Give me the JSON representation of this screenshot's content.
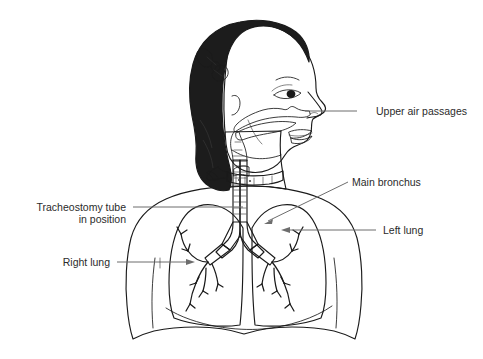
{
  "palette": {
    "background": "#ffffff",
    "ink": "#1a1a1a",
    "hair": "#1c1c1c",
    "skin": "#c9c9c9",
    "skin_shadow": "#bdbdbd",
    "torso": "#dcdcdc",
    "lung_fill": "#d2d2d2",
    "airway": "#a8a8a8",
    "airway_dark": "#9a9a9a",
    "lip": "#8c8c8c",
    "collar_white": "#fbfbfb",
    "leader": "#6d6d6d",
    "label_text": "#2b2b2b"
  },
  "labels": [
    {
      "id": "upper-air-passages",
      "text": "Upper air passages",
      "align": "left",
      "text_x": 376,
      "text_y": 115,
      "leader": {
        "type": "line",
        "x1": 357,
        "y1": 111,
        "x2": 305,
        "y2": 111
      },
      "arrow": null
    },
    {
      "id": "main-bronchus",
      "text": "Main bronchus",
      "align": "left",
      "text_x": 352,
      "text_y": 186,
      "leader": {
        "type": "line",
        "x1": 348,
        "y1": 182,
        "x2": 266,
        "y2": 222
      },
      "arrow": {
        "x": 266,
        "y": 222,
        "angle": 206
      }
    },
    {
      "id": "left-lung",
      "text": "Left lung",
      "align": "left",
      "text_x": 383,
      "text_y": 234,
      "leader": {
        "type": "line",
        "x1": 376,
        "y1": 230,
        "x2": 284,
        "y2": 230
      },
      "arrow": {
        "x": 284,
        "y": 230,
        "angle": 180
      }
    },
    {
      "id": "tracheostomy-tube",
      "text_line_1": "Tracheostomy tube",
      "text_line_2": "in position",
      "align": "right",
      "text_x": 126,
      "text_y": 211,
      "text_y2": 222,
      "leader": {
        "type": "line",
        "x1": 133,
        "y1": 207,
        "x2": 243,
        "y2": 207
      },
      "arrow": null
    },
    {
      "id": "right-lung",
      "text": "Right lung",
      "align": "right",
      "text_x": 110,
      "text_y": 266,
      "leader": {
        "type": "line",
        "x1": 117,
        "y1": 262,
        "x2": 192,
        "y2": 262
      },
      "arrow": {
        "x": 192,
        "y": 262,
        "angle": 0
      }
    }
  ],
  "anatomy": {
    "parts": [
      "hair-with-bow",
      "face-profile",
      "eye",
      "eyebrow",
      "nose",
      "lips",
      "ear",
      "nasal-passage",
      "oral-cavity",
      "pharynx",
      "trachea",
      "tracheostomy-collar",
      "carina",
      "right-lung",
      "left-lung",
      "bronchial-tree",
      "torso-outline",
      "diaphragm"
    ]
  }
}
